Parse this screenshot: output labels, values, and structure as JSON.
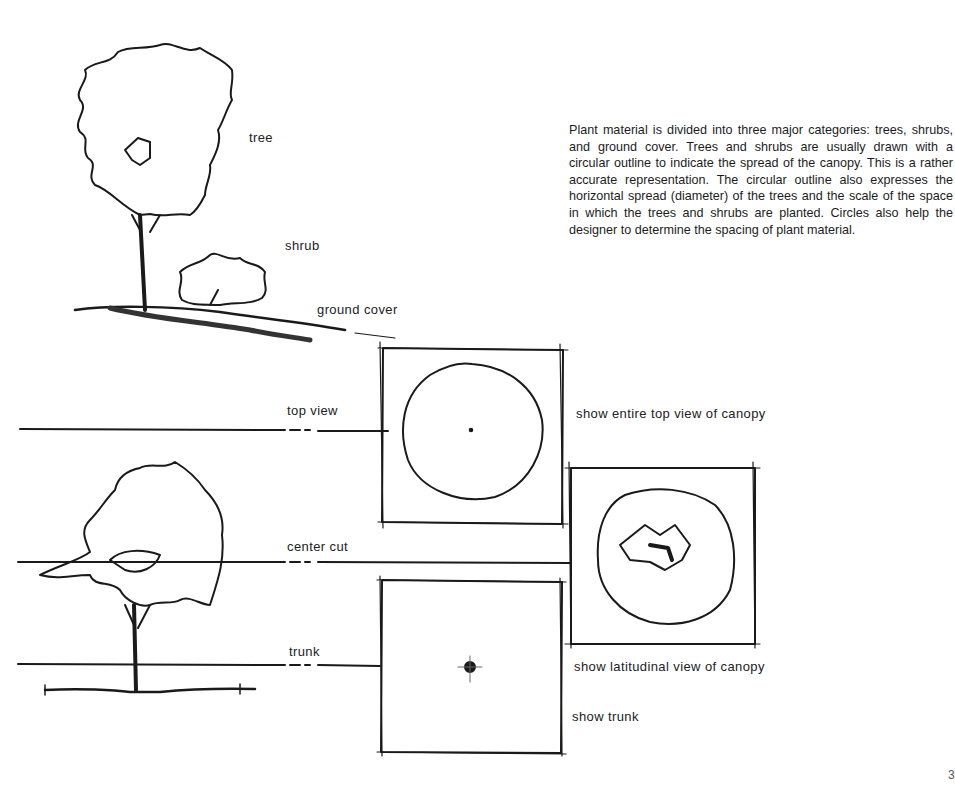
{
  "labels": {
    "tree": "tree",
    "shrub": "shrub",
    "ground_cover": "ground cover",
    "top_view": "top view",
    "center_cut": "center cut",
    "trunk": "trunk",
    "show_top": "show entire top view of canopy",
    "show_latitudinal": "show latitudinal view of canopy",
    "show_trunk": "show trunk"
  },
  "paragraph": "Plant material is divided into three major categories: trees, shrubs, and ground cover. Trees and shrubs are usually drawn with a circular outline to indicate the spread of the canopy. This is a rather accurate representation. The circular outline also expresses the horizontal spread (diameter) of the trees and the scale of the space in which the trees and shrubs are planted. Circles also help the designer to determine the spacing of plant material.",
  "page_number": "3",
  "colors": {
    "ink": "#1a1a1a",
    "paper": "#ffffff"
  }
}
